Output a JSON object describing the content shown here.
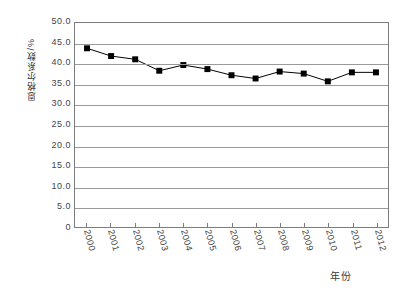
{
  "chart_data": {
    "type": "line",
    "title": "",
    "subtitle": "",
    "xlabel": "年份",
    "ylabel": "恩格尔系数/%",
    "categories": [
      "2000",
      "2001",
      "2002",
      "2003",
      "2004",
      "2005",
      "2006",
      "2007",
      "2008",
      "2009",
      "2010",
      "2011",
      "2012"
    ],
    "values": [
      43.8,
      41.9,
      41.1,
      38.3,
      39.7,
      38.7,
      37.2,
      36.4,
      38.1,
      37.6,
      35.7,
      37.9,
      37.9
    ],
    "series": [
      {
        "name": "恩格尔系数",
        "values": [
          43.8,
          41.9,
          41.1,
          38.3,
          39.7,
          38.7,
          37.2,
          36.4,
          38.1,
          37.6,
          35.7,
          37.9,
          37.9
        ]
      }
    ],
    "ylim": [
      0,
      50
    ],
    "ytick_step": 5,
    "ytick_labels": [
      "50.0",
      "45.0",
      "40.0",
      "35.0",
      "30.0",
      "25.0",
      "20.0",
      "15.0",
      "10.0",
      "5.0",
      "0"
    ],
    "ytick_values": [
      50,
      45,
      40,
      35,
      30,
      25,
      20,
      15,
      10,
      5,
      0
    ],
    "grid": true,
    "grid_axis": "y",
    "legend": false,
    "legend_position": "none",
    "marker": "square",
    "marker_color": "#000000",
    "line_color": "#000000",
    "grid_color": "#9a9a9a",
    "frame_color": "#7c7c7c",
    "background": "#ffffff"
  }
}
